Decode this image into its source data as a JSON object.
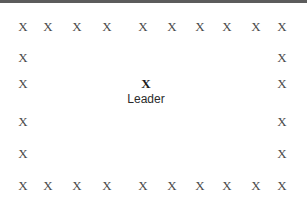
{
  "diagram": {
    "type": "formation-layout",
    "background_color": "#ffffff",
    "top_rule": {
      "name": "horizontal-divider",
      "color": "#5c5c5c",
      "height_px": 3
    },
    "mark_glyph": "X",
    "mark_color": "#4a4a4a",
    "leader": {
      "glyph": "X",
      "label": "Leader",
      "color": "#1c1c1c",
      "x": 139,
      "y": 77
    },
    "top_row": {
      "name": "top-row",
      "y": 20,
      "marks": [
        {
          "label": "X",
          "x": 16
        },
        {
          "label": "X",
          "x": 41
        },
        {
          "label": "X",
          "x": 70
        },
        {
          "label": "X",
          "x": 100
        },
        {
          "label": "X",
          "x": 136
        },
        {
          "label": "X",
          "x": 165
        },
        {
          "label": "X",
          "x": 193
        },
        {
          "label": "X",
          "x": 220
        },
        {
          "label": "X",
          "x": 249
        },
        {
          "label": "X",
          "x": 275
        }
      ]
    },
    "bottom_row": {
      "name": "bottom-row",
      "y": 179,
      "marks": [
        {
          "label": "X",
          "x": 16
        },
        {
          "label": "X",
          "x": 41
        },
        {
          "label": "X",
          "x": 70
        },
        {
          "label": "X",
          "x": 100
        },
        {
          "label": "X",
          "x": 136
        },
        {
          "label": "X",
          "x": 165
        },
        {
          "label": "X",
          "x": 193
        },
        {
          "label": "X",
          "x": 220
        },
        {
          "label": "X",
          "x": 249
        },
        {
          "label": "X",
          "x": 275
        }
      ]
    },
    "left_column": {
      "name": "left-column",
      "x": 16,
      "marks": [
        {
          "label": "X",
          "y": 20
        },
        {
          "label": "X",
          "y": 51
        },
        {
          "label": "X",
          "y": 77
        },
        {
          "label": "X",
          "y": 115
        },
        {
          "label": "X",
          "y": 147
        },
        {
          "label": "X",
          "y": 179
        }
      ]
    },
    "right_column": {
      "name": "right-column",
      "x": 275,
      "marks": [
        {
          "label": "X",
          "y": 20
        },
        {
          "label": "X",
          "y": 51
        },
        {
          "label": "X",
          "y": 77
        },
        {
          "label": "X",
          "y": 115
        },
        {
          "label": "X",
          "y": 147
        },
        {
          "label": "X",
          "y": 179
        }
      ]
    }
  }
}
